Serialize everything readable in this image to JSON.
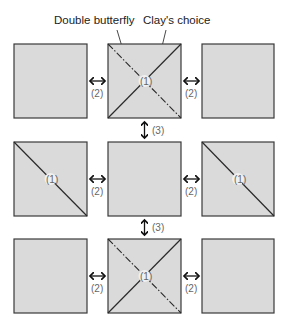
{
  "labels": {
    "double_butterfly": "Double butterfly",
    "clays_choice": "Clay's choice"
  },
  "steps": {
    "fold": "(1)",
    "side": "(2)",
    "vertical": "(3)"
  },
  "colors": {
    "square_fill": "#dadada",
    "square_stroke": "#3a3a3a",
    "line": "#2a2a2a",
    "text": "#222222",
    "step_text": "#666666"
  },
  "grid": {
    "rows": [
      {
        "left": "plain",
        "middle": "x-dashdot",
        "right": "plain"
      },
      {
        "left": "diagonal",
        "middle": "plain",
        "right": "diagonal"
      },
      {
        "left": "plain",
        "middle": "x-dashdot",
        "right": "plain"
      }
    ]
  }
}
